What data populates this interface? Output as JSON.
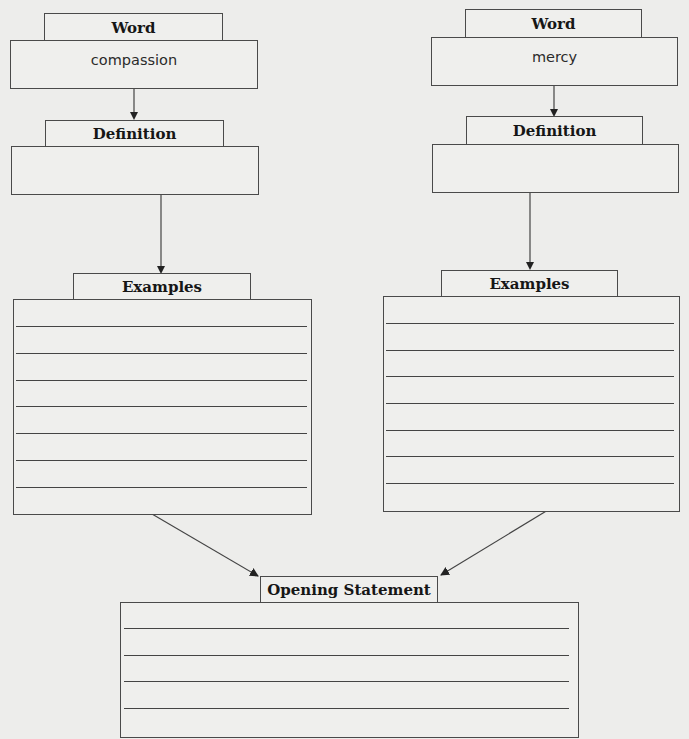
{
  "left_column": {
    "word_label": "Word",
    "word_value": "compassion",
    "definition_label": "Definition",
    "definition_value": "",
    "examples_label": "Examples",
    "examples_line_count": 7
  },
  "right_column": {
    "word_label": "Word",
    "word_value": "mercy",
    "definition_label": "Definition",
    "definition_value": "",
    "examples_label": "Examples",
    "examples_line_count": 7
  },
  "opening_statement": {
    "label": "Opening Statement",
    "line_count": 4
  },
  "colors": {
    "paper": "#ededeb",
    "stroke": "#4a4a4a",
    "text": "#161616"
  }
}
